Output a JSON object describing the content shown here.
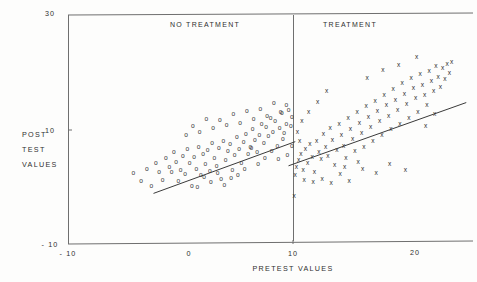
{
  "chart_data": {
    "type": "scatter",
    "title": "",
    "xlabel": "PRETEST VALUES",
    "ylabel": "POST TEST VALUES",
    "ylabel_lines": [
      "POST",
      "TEST",
      "VALUES"
    ],
    "xlim": [
      -10,
      25
    ],
    "ylim": [
      -10,
      30
    ],
    "xticks": [
      -10,
      0,
      10,
      20
    ],
    "xtick_labels": [
      "- 10",
      "0",
      "10",
      "20"
    ],
    "yticks": [
      -10,
      10,
      30
    ],
    "ytick_labels": [
      "- 10",
      "10",
      "30"
    ],
    "grid": false,
    "legend": "none",
    "panel_divider_x": 10,
    "annotations": [
      {
        "text": "NO TREATMENT",
        "x": 1.5,
        "y": 28.5
      },
      {
        "text": "TREATMENT",
        "x": 15.5,
        "y": 28.5
      }
    ],
    "series": [
      {
        "name": "No treatment",
        "marker": "o",
        "points": [
          [
            -4.2,
            2.4
          ],
          [
            -3.5,
            1.0
          ],
          [
            -3.0,
            3.2
          ],
          [
            -2.6,
            0.2
          ],
          [
            -2.2,
            4.2
          ],
          [
            -1.9,
            2.6
          ],
          [
            -1.6,
            1.2
          ],
          [
            -1.3,
            5.0
          ],
          [
            -1.0,
            3.4
          ],
          [
            -0.8,
            2.6
          ],
          [
            -0.6,
            6.0
          ],
          [
            -0.4,
            4.4
          ],
          [
            -0.2,
            1.0
          ],
          [
            0.0,
            3.0
          ],
          [
            0.2,
            5.4
          ],
          [
            0.4,
            2.2
          ],
          [
            0.6,
            6.6
          ],
          [
            0.8,
            4.2
          ],
          [
            1.0,
            0.2
          ],
          [
            1.2,
            5.2
          ],
          [
            1.4,
            3.2
          ],
          [
            1.6,
            7.0
          ],
          [
            1.8,
            2.0
          ],
          [
            2.0,
            5.8
          ],
          [
            2.2,
            4.0
          ],
          [
            2.4,
            6.4
          ],
          [
            2.6,
            2.8
          ],
          [
            2.8,
            7.6
          ],
          [
            3.0,
            5.0
          ],
          [
            3.2,
            3.6
          ],
          [
            3.4,
            6.8
          ],
          [
            3.6,
            1.4
          ],
          [
            3.8,
            8.0
          ],
          [
            4.0,
            4.6
          ],
          [
            4.2,
            6.2
          ],
          [
            4.4,
            7.4
          ],
          [
            4.6,
            3.0
          ],
          [
            4.8,
            5.6
          ],
          [
            5.0,
            8.6
          ],
          [
            5.2,
            6.6
          ],
          [
            5.4,
            4.2
          ],
          [
            5.6,
            7.8
          ],
          [
            5.8,
            9.2
          ],
          [
            6.0,
            5.8
          ],
          [
            6.2,
            7.0
          ],
          [
            6.4,
            10.0
          ],
          [
            6.6,
            8.2
          ],
          [
            6.8,
            6.0
          ],
          [
            7.0,
            9.0
          ],
          [
            7.2,
            11.0
          ],
          [
            7.4,
            7.6
          ],
          [
            7.6,
            10.4
          ],
          [
            7.8,
            8.8
          ],
          [
            8.0,
            12.0
          ],
          [
            8.2,
            9.6
          ],
          [
            8.4,
            11.4
          ],
          [
            8.6,
            7.2
          ],
          [
            8.8,
            10.2
          ],
          [
            9.0,
            12.8
          ],
          [
            9.2,
            9.4
          ],
          [
            9.4,
            11.0
          ],
          [
            9.6,
            13.4
          ],
          [
            9.8,
            10.6
          ],
          [
            9.9,
            12.2
          ],
          [
            9.4,
            14.2
          ],
          [
            8.9,
            13.0
          ],
          [
            8.3,
            14.6
          ],
          [
            7.7,
            12.4
          ],
          [
            7.1,
            13.6
          ],
          [
            6.5,
            11.8
          ],
          [
            5.9,
            13.2
          ],
          [
            5.3,
            11.2
          ],
          [
            4.7,
            12.6
          ],
          [
            4.1,
            10.8
          ],
          [
            3.5,
            11.6
          ],
          [
            2.9,
            10.2
          ],
          [
            2.3,
            11.8
          ],
          [
            1.7,
            9.6
          ],
          [
            1.1,
            10.6
          ],
          [
            0.5,
            9.0
          ],
          [
            9.9,
            7.2
          ],
          [
            9.5,
            5.6
          ],
          [
            9.1,
            8.4
          ],
          [
            8.7,
            4.8
          ],
          [
            8.1,
            6.2
          ],
          [
            7.5,
            5.0
          ],
          [
            6.9,
            4.0
          ],
          [
            6.3,
            6.8
          ],
          [
            5.7,
            3.2
          ],
          [
            5.1,
            2.0
          ],
          [
            4.5,
            1.6
          ],
          [
            3.9,
            0.4
          ],
          [
            3.3,
            2.4
          ],
          [
            2.7,
            0.8
          ],
          [
            2.1,
            1.8
          ],
          [
            1.5,
            0.0
          ]
        ],
        "fit_line": {
          "x0": -2.4,
          "y0": -1.2,
          "x1": 10.2,
          "y1": 7.8
        }
      },
      {
        "name": "Treatment",
        "marker": "x",
        "points": [
          [
            10.1,
            -1.6
          ],
          [
            10.2,
            2.0
          ],
          [
            10.3,
            3.4
          ],
          [
            10.5,
            4.6
          ],
          [
            10.7,
            5.8
          ],
          [
            10.9,
            3.0
          ],
          [
            11.1,
            6.6
          ],
          [
            11.3,
            4.2
          ],
          [
            11.5,
            7.4
          ],
          [
            11.7,
            5.2
          ],
          [
            11.9,
            2.6
          ],
          [
            12.1,
            8.0
          ],
          [
            12.3,
            6.0
          ],
          [
            12.5,
            4.8
          ],
          [
            12.7,
            9.2
          ],
          [
            12.9,
            7.0
          ],
          [
            13.1,
            5.4
          ],
          [
            13.3,
            10.2
          ],
          [
            13.5,
            8.2
          ],
          [
            13.7,
            3.8
          ],
          [
            13.9,
            6.4
          ],
          [
            14.1,
            11.0
          ],
          [
            14.3,
            9.0
          ],
          [
            14.5,
            7.2
          ],
          [
            14.7,
            5.0
          ],
          [
            14.9,
            12.0
          ],
          [
            15.1,
            10.0
          ],
          [
            15.3,
            8.4
          ],
          [
            15.5,
            6.2
          ],
          [
            15.7,
            13.0
          ],
          [
            15.9,
            11.2
          ],
          [
            16.1,
            9.4
          ],
          [
            16.3,
            7.0
          ],
          [
            16.5,
            14.0
          ],
          [
            16.7,
            12.2
          ],
          [
            16.9,
            10.4
          ],
          [
            17.1,
            8.0
          ],
          [
            17.3,
            15.0
          ],
          [
            17.5,
            13.2
          ],
          [
            17.7,
            11.4
          ],
          [
            17.9,
            9.0
          ],
          [
            18.1,
            16.0
          ],
          [
            18.3,
            14.2
          ],
          [
            18.5,
            12.4
          ],
          [
            18.7,
            10.0
          ],
          [
            18.9,
            17.0
          ],
          [
            19.1,
            15.2
          ],
          [
            19.3,
            13.4
          ],
          [
            19.5,
            11.0
          ],
          [
            19.7,
            18.0
          ],
          [
            19.9,
            16.2
          ],
          [
            20.1,
            14.4
          ],
          [
            20.3,
            12.0
          ],
          [
            20.5,
            19.0
          ],
          [
            20.7,
            17.2
          ],
          [
            20.9,
            15.4
          ],
          [
            21.1,
            13.0
          ],
          [
            21.3,
            19.6
          ],
          [
            21.5,
            17.8
          ],
          [
            21.7,
            16.0
          ],
          [
            21.9,
            14.2
          ],
          [
            22.1,
            20.2
          ],
          [
            22.3,
            18.4
          ],
          [
            22.5,
            16.6
          ],
          [
            22.7,
            21.0
          ],
          [
            22.9,
            19.2
          ],
          [
            23.1,
            17.4
          ],
          [
            23.3,
            20.6
          ],
          [
            23.5,
            18.8
          ],
          [
            23.7,
            21.4
          ],
          [
            23.9,
            19.8
          ],
          [
            24.1,
            21.8
          ],
          [
            21.0,
            22.6
          ],
          [
            19.4,
            21.2
          ],
          [
            18.0,
            20.4
          ],
          [
            16.6,
            19.0
          ],
          [
            13.0,
            16.6
          ],
          [
            12.2,
            14.8
          ],
          [
            11.4,
            13.0
          ],
          [
            10.8,
            11.4
          ],
          [
            10.4,
            9.6
          ],
          [
            10.6,
            8.0
          ],
          [
            11.0,
            1.2
          ],
          [
            11.8,
            0.8
          ],
          [
            12.6,
            1.4
          ],
          [
            13.4,
            0.6
          ],
          [
            14.2,
            2.2
          ],
          [
            15.0,
            1.0
          ],
          [
            16.2,
            3.2
          ],
          [
            17.4,
            2.4
          ],
          [
            18.6,
            4.0
          ],
          [
            20.0,
            3.0
          ],
          [
            21.8,
            10.6
          ],
          [
            22.6,
            12.6
          ],
          [
            15.8,
            4.4
          ],
          [
            14.6,
            3.4
          ]
        ],
        "fit_line": {
          "x0": 9.6,
          "y0": 3.6,
          "x1": 25.4,
          "y1": 14.6
        }
      }
    ]
  },
  "axes": {
    "x_axis_name": "pretest-axis",
    "y_axis_name": "posttest-axis"
  }
}
